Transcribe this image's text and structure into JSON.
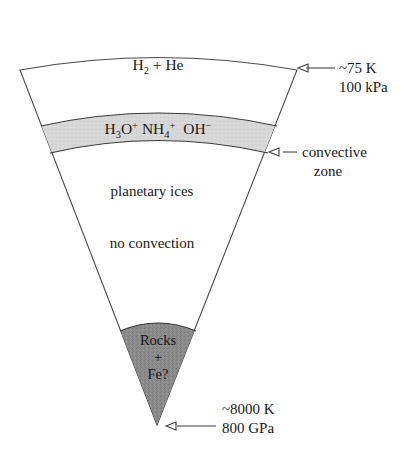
{
  "figure": {
    "name": "planetary-interior-wedge-cross-section",
    "background_color": "#ffffff",
    "outline_color": "#4a4a4a"
  },
  "layers": {
    "atmosphere": {
      "label_main": "H",
      "label_sub": "2",
      "label_rest": " + He",
      "label_plain": "H2 + He",
      "fill_color": "#ffffff"
    },
    "ionic_band": {
      "fill_color": "#d5d5d5",
      "species": [
        {
          "base_a": "H",
          "sub": "3",
          "base_b": "O",
          "sup": "+",
          "plain": "H3O+"
        },
        {
          "base_a": "NH",
          "sub": "4",
          "sup": "+",
          "plain": "NH4+"
        },
        {
          "base_a": "OH",
          "sup": "−",
          "plain": "OH-"
        }
      ],
      "species_plain": "H3O+ NH4+ OH-"
    },
    "mantle": {
      "label_upper": "planetary ices",
      "label_lower": "no convection",
      "fill_color": "#ffffff"
    },
    "core": {
      "line1": "Rocks",
      "line2": "+",
      "line3": "Fe?",
      "plain": "Rocks + Fe?",
      "fill_color": "#8a8a8a"
    }
  },
  "annotations": [
    {
      "id": "outer-boundary-conditions",
      "line1": "~75 K",
      "line2": "100 kPa",
      "target": "outer wedge corner"
    },
    {
      "id": "convective-zone",
      "line1": "convective",
      "line2": "zone",
      "target": "base of ionic band"
    },
    {
      "id": "center-conditions",
      "line1": "~8000 K",
      "line2": "800 GPa",
      "target": "wedge apex"
    }
  ]
}
